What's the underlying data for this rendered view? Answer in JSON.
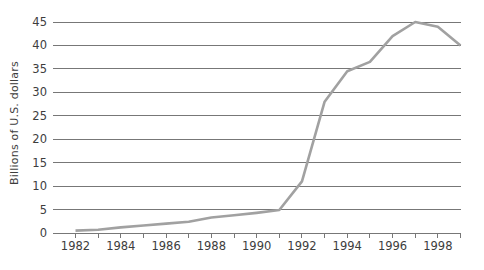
{
  "chart_data": {
    "type": "line",
    "title": "",
    "xlabel": "",
    "ylabel": "Billions of U.S. dollars",
    "x": [
      1982,
      1983,
      1984,
      1985,
      1986,
      1987,
      1988,
      1989,
      1990,
      1991,
      1992,
      1993,
      1994,
      1995,
      1996,
      1997,
      1998,
      1999
    ],
    "series": [
      {
        "name": "Billions of U.S. dollars",
        "values": [
          0.5,
          0.7,
          1.2,
          1.6,
          2.0,
          2.4,
          3.3,
          3.8,
          4.3,
          4.9,
          11,
          28,
          34.5,
          36.5,
          42,
          45,
          44,
          40
        ]
      }
    ],
    "ylim": [
      0,
      45
    ],
    "yticks": [
      0,
      5,
      10,
      15,
      20,
      25,
      30,
      35,
      40,
      45
    ],
    "xtick_labels": [
      "1982",
      "1984",
      "1986",
      "1988",
      "1990",
      "1992",
      "1994",
      "1996",
      "1998"
    ],
    "grid": "horizontal-only",
    "legend_position": "none",
    "colors": {
      "line": "#a1a1a1",
      "grid": "#777777",
      "text": "#3d3d3d",
      "background": "#ffffff"
    }
  }
}
